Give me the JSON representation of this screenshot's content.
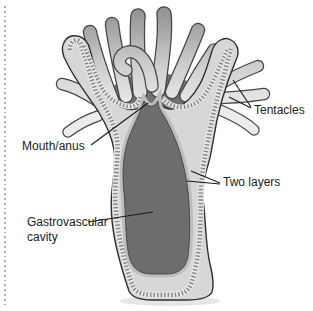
{
  "diagram": {
    "labels": {
      "tentacles": "Tentacles",
      "mouth_anus": "Mouth/anus",
      "two_layers": "Two layers",
      "gastrovascular_cavity": "Gastrovascular cavity"
    },
    "colors": {
      "background": "#ffffff",
      "body_wall": "#d7d7d7",
      "wall_ribbon": "#e6e6e6",
      "stipple_dots": "#868686",
      "gastrovascular_cavity": "#6d6d6d",
      "outline": "#2e2e2e",
      "tentacle_light": "#ececec",
      "tentacle_dark": "#969696",
      "leader_line": "#1a1a1a",
      "label_text": "#1b1b1b",
      "dotted_border": "#a9a9a9"
    }
  }
}
